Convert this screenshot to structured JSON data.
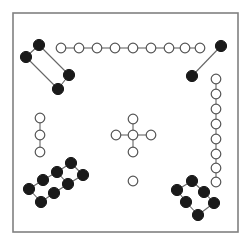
{
  "figure": {
    "title": "",
    "background_color": "#ffffff",
    "frame": {
      "x": 13,
      "y": 13,
      "width": 225,
      "height": 219,
      "stroke_color": "#808080",
      "stroke_width": 1.6,
      "fill": "#ffffff"
    },
    "node_styles": {
      "filled": {
        "fill": "#1a1a1a",
        "stroke": "#1a1a1a",
        "radius": 5.6
      },
      "open": {
        "fill": "#ffffff",
        "stroke": "#555555",
        "radius": 4.8
      }
    },
    "edge_style": {
      "stroke": "#666666",
      "stroke_width": 1.1
    }
  },
  "chart_data": {
    "type": "scatter",
    "title": "",
    "xlabel": "",
    "ylabel": "",
    "xlim": [
      0,
      252
    ],
    "ylim": [
      0,
      244
    ],
    "grid": false,
    "legend": [
      {
        "label": "filled-node",
        "marker": "filled-circle",
        "color": "#1a1a1a"
      },
      {
        "label": "open-node",
        "marker": "open-circle",
        "color": "#ffffff"
      }
    ],
    "node_count": 45,
    "edge_count": 41,
    "cluster_count": 8,
    "clusters": [
      {
        "name": "top-left-filled-parallelogram",
        "style": "filled",
        "node_count": 4,
        "edge_count": 4
      },
      {
        "name": "top-open-chain",
        "style": "open",
        "node_count": 9,
        "edge_count": 8
      },
      {
        "name": "top-right-filled-pair",
        "style": "filled",
        "node_count": 2,
        "edge_count": 1
      },
      {
        "name": "right-open-chain",
        "style": "open",
        "node_count": 8,
        "edge_count": 7
      },
      {
        "name": "left-open-chain",
        "style": "open",
        "node_count": 3,
        "edge_count": 2
      },
      {
        "name": "center-open-cross",
        "style": "open",
        "node_count": 5,
        "edge_count": 4
      },
      {
        "name": "center-isolated-node",
        "style": "open",
        "node_count": 1,
        "edge_count": 0
      },
      {
        "name": "bottom-left-filled-ladder",
        "style": "filled",
        "node_count": 8,
        "edge_count": 9
      },
      {
        "name": "bottom-right-filled-ring",
        "style": "filled",
        "node_count": 6,
        "edge_count": 6
      }
    ],
    "nodes": [
      {
        "id": "tl0",
        "x": 39,
        "y": 45,
        "style": "filled",
        "cluster": "top-left-filled-parallelogram"
      },
      {
        "id": "tl1",
        "x": 26,
        "y": 57,
        "style": "filled",
        "cluster": "top-left-filled-parallelogram"
      },
      {
        "id": "tl2",
        "x": 69,
        "y": 75,
        "style": "filled",
        "cluster": "top-left-filled-parallelogram"
      },
      {
        "id": "tl3",
        "x": 58,
        "y": 89,
        "style": "filled",
        "cluster": "top-left-filled-parallelogram"
      },
      {
        "id": "tc0",
        "x": 61,
        "y": 48,
        "style": "open",
        "cluster": "top-open-chain"
      },
      {
        "id": "tc1",
        "x": 79,
        "y": 48,
        "style": "open",
        "cluster": "top-open-chain"
      },
      {
        "id": "tc2",
        "x": 97,
        "y": 48,
        "style": "open",
        "cluster": "top-open-chain"
      },
      {
        "id": "tc3",
        "x": 115,
        "y": 48,
        "style": "open",
        "cluster": "top-open-chain"
      },
      {
        "id": "tc4",
        "x": 133,
        "y": 48,
        "style": "open",
        "cluster": "top-open-chain"
      },
      {
        "id": "tc5",
        "x": 151,
        "y": 48,
        "style": "open",
        "cluster": "top-open-chain"
      },
      {
        "id": "tc6",
        "x": 169,
        "y": 48,
        "style": "open",
        "cluster": "top-open-chain"
      },
      {
        "id": "tc7",
        "x": 185,
        "y": 48,
        "style": "open",
        "cluster": "top-open-chain"
      },
      {
        "id": "tc8",
        "x": 200,
        "y": 48,
        "style": "open",
        "cluster": "top-open-chain"
      },
      {
        "id": "tr0",
        "x": 221,
        "y": 46,
        "style": "filled",
        "cluster": "top-right-filled-pair"
      },
      {
        "id": "tr1",
        "x": 192,
        "y": 76,
        "style": "filled",
        "cluster": "top-right-filled-pair"
      },
      {
        "id": "rc0",
        "x": 216,
        "y": 79,
        "style": "open",
        "cluster": "right-open-chain"
      },
      {
        "id": "rc1",
        "x": 216,
        "y": 94,
        "style": "open",
        "cluster": "right-open-chain"
      },
      {
        "id": "rc2",
        "x": 216,
        "y": 109,
        "style": "open",
        "cluster": "right-open-chain"
      },
      {
        "id": "rc3",
        "x": 216,
        "y": 124,
        "style": "open",
        "cluster": "right-open-chain"
      },
      {
        "id": "rc4",
        "x": 216,
        "y": 139,
        "style": "open",
        "cluster": "right-open-chain"
      },
      {
        "id": "rc5",
        "x": 216,
        "y": 154,
        "style": "open",
        "cluster": "right-open-chain"
      },
      {
        "id": "rc6",
        "x": 216,
        "y": 168,
        "style": "open",
        "cluster": "right-open-chain"
      },
      {
        "id": "rc7",
        "x": 216,
        "y": 182,
        "style": "open",
        "cluster": "right-open-chain"
      },
      {
        "id": "lc0",
        "x": 40,
        "y": 118,
        "style": "open",
        "cluster": "left-open-chain"
      },
      {
        "id": "lc1",
        "x": 40,
        "y": 135,
        "style": "open",
        "cluster": "left-open-chain"
      },
      {
        "id": "lc2",
        "x": 40,
        "y": 152,
        "style": "open",
        "cluster": "left-open-chain"
      },
      {
        "id": "cx0",
        "x": 133,
        "y": 135,
        "style": "open",
        "cluster": "center-open-cross"
      },
      {
        "id": "cx1",
        "x": 133,
        "y": 119,
        "style": "open",
        "cluster": "center-open-cross"
      },
      {
        "id": "cx2",
        "x": 133,
        "y": 152,
        "style": "open",
        "cluster": "center-open-cross"
      },
      {
        "id": "cx3",
        "x": 116,
        "y": 135,
        "style": "open",
        "cluster": "center-open-cross"
      },
      {
        "id": "cx4",
        "x": 151,
        "y": 135,
        "style": "open",
        "cluster": "center-open-cross"
      },
      {
        "id": "iso0",
        "x": 133,
        "y": 181,
        "style": "open",
        "cluster": "center-isolated-node"
      },
      {
        "id": "bl0",
        "x": 71,
        "y": 163,
        "style": "filled",
        "cluster": "bottom-left-filled-ladder"
      },
      {
        "id": "bl1",
        "x": 57,
        "y": 172,
        "style": "filled",
        "cluster": "bottom-left-filled-ladder"
      },
      {
        "id": "bl2",
        "x": 43,
        "y": 180,
        "style": "filled",
        "cluster": "bottom-left-filled-ladder"
      },
      {
        "id": "bl3",
        "x": 29,
        "y": 189,
        "style": "filled",
        "cluster": "bottom-left-filled-ladder"
      },
      {
        "id": "bl4",
        "x": 83,
        "y": 175,
        "style": "filled",
        "cluster": "bottom-left-filled-ladder"
      },
      {
        "id": "bl5",
        "x": 68,
        "y": 184,
        "style": "filled",
        "cluster": "bottom-left-filled-ladder"
      },
      {
        "id": "bl6",
        "x": 54,
        "y": 193,
        "style": "filled",
        "cluster": "bottom-left-filled-ladder"
      },
      {
        "id": "bl7",
        "x": 41,
        "y": 202,
        "style": "filled",
        "cluster": "bottom-left-filled-ladder"
      },
      {
        "id": "br0",
        "x": 192,
        "y": 181,
        "style": "filled",
        "cluster": "bottom-right-filled-ring"
      },
      {
        "id": "br1",
        "x": 177,
        "y": 190,
        "style": "filled",
        "cluster": "bottom-right-filled-ring"
      },
      {
        "id": "br2",
        "x": 204,
        "y": 192,
        "style": "filled",
        "cluster": "bottom-right-filled-ring"
      },
      {
        "id": "br3",
        "x": 186,
        "y": 202,
        "style": "filled",
        "cluster": "bottom-right-filled-ring"
      },
      {
        "id": "br4",
        "x": 214,
        "y": 203,
        "style": "filled",
        "cluster": "bottom-right-filled-ring"
      },
      {
        "id": "br5",
        "x": 198,
        "y": 215,
        "style": "filled",
        "cluster": "bottom-right-filled-ring"
      }
    ],
    "edges": [
      [
        "tl0",
        "tl1"
      ],
      [
        "tl0",
        "tl2"
      ],
      [
        "tl1",
        "tl3"
      ],
      [
        "tl2",
        "tl3"
      ],
      [
        "tc0",
        "tc1"
      ],
      [
        "tc1",
        "tc2"
      ],
      [
        "tc2",
        "tc3"
      ],
      [
        "tc3",
        "tc4"
      ],
      [
        "tc4",
        "tc5"
      ],
      [
        "tc5",
        "tc6"
      ],
      [
        "tc6",
        "tc7"
      ],
      [
        "tc7",
        "tc8"
      ],
      [
        "tr0",
        "tr1"
      ],
      [
        "rc0",
        "rc1"
      ],
      [
        "rc1",
        "rc2"
      ],
      [
        "rc2",
        "rc3"
      ],
      [
        "rc3",
        "rc4"
      ],
      [
        "rc4",
        "rc5"
      ],
      [
        "rc5",
        "rc6"
      ],
      [
        "rc6",
        "rc7"
      ],
      [
        "lc0",
        "lc1"
      ],
      [
        "lc1",
        "lc2"
      ],
      [
        "cx0",
        "cx1"
      ],
      [
        "cx0",
        "cx2"
      ],
      [
        "cx0",
        "cx3"
      ],
      [
        "cx0",
        "cx4"
      ],
      [
        "bl0",
        "bl1"
      ],
      [
        "bl1",
        "bl2"
      ],
      [
        "bl2",
        "bl3"
      ],
      [
        "bl4",
        "bl5"
      ],
      [
        "bl5",
        "bl6"
      ],
      [
        "bl6",
        "bl7"
      ],
      [
        "bl0",
        "bl4"
      ],
      [
        "bl3",
        "bl7"
      ],
      [
        "bl1",
        "bl5"
      ],
      [
        "br0",
        "br1"
      ],
      [
        "br0",
        "br2"
      ],
      [
        "br1",
        "br3"
      ],
      [
        "br2",
        "br4"
      ],
      [
        "br3",
        "br5"
      ],
      [
        "br4",
        "br5"
      ]
    ]
  }
}
